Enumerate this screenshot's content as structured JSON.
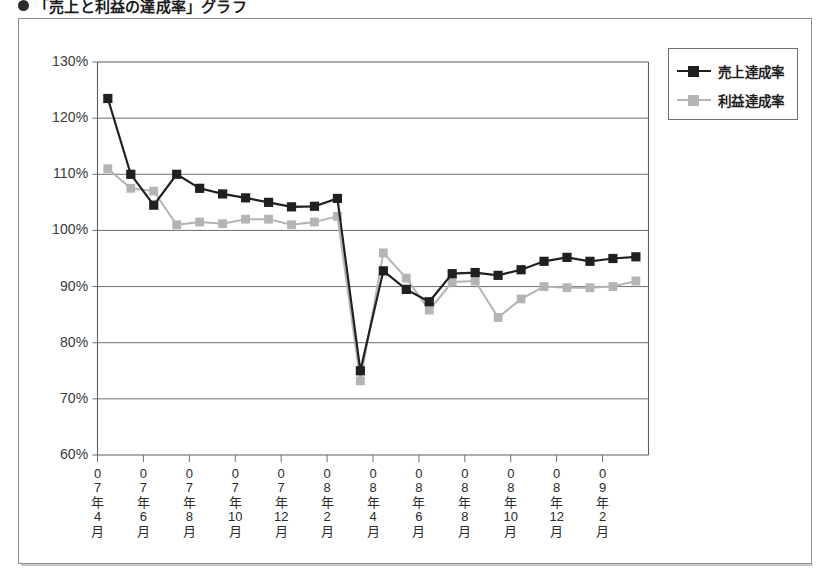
{
  "heading": {
    "bullet_icon": "filled-circle-bullet",
    "text": "「売上と利益の達成率」グラフ"
  },
  "legend": {
    "position": "top-right",
    "items": [
      {
        "label": "売上達成率",
        "color": "#221f1f",
        "marker": "square"
      },
      {
        "label": "利益達成率",
        "color": "#b4b4b4",
        "marker": "square"
      }
    ]
  },
  "axis": {
    "y_ticks": [
      "60%",
      "70%",
      "80%",
      "90%",
      "100%",
      "110%",
      "120%",
      "130%"
    ],
    "x_ticks": [
      {
        "year": "0",
        "year2": "7",
        "nen": "年",
        "month": "4",
        "getsu": "月"
      },
      {
        "year": "0",
        "year2": "7",
        "nen": "年",
        "month": "6",
        "getsu": "月"
      },
      {
        "year": "0",
        "year2": "7",
        "nen": "年",
        "month": "8",
        "getsu": "月"
      },
      {
        "year": "0",
        "year2": "7",
        "nen": "年",
        "month": "10",
        "getsu": "月"
      },
      {
        "year": "0",
        "year2": "7",
        "nen": "年",
        "month": "12",
        "getsu": "月"
      },
      {
        "year": "0",
        "year2": "8",
        "nen": "年",
        "month": "2",
        "getsu": "月"
      },
      {
        "year": "0",
        "year2": "8",
        "nen": "年",
        "month": "4",
        "getsu": "月"
      },
      {
        "year": "0",
        "year2": "8",
        "nen": "年",
        "month": "6",
        "getsu": "月"
      },
      {
        "year": "0",
        "year2": "8",
        "nen": "年",
        "month": "8",
        "getsu": "月"
      },
      {
        "year": "0",
        "year2": "8",
        "nen": "年",
        "month": "10",
        "getsu": "月"
      },
      {
        "year": "0",
        "year2": "8",
        "nen": "年",
        "month": "12",
        "getsu": "月"
      },
      {
        "year": "0",
        "year2": "9",
        "nen": "年",
        "month": "2",
        "getsu": "月"
      }
    ]
  },
  "chart_data": {
    "type": "line",
    "title": "「売上と利益の達成率」グラフ",
    "xlabel": "",
    "ylabel": "",
    "ylim": [
      60,
      130
    ],
    "ytick_step": 10,
    "ytick_format": "percent",
    "grid": "horizontal",
    "legend_position": "top-right",
    "categories": [
      "07年4月",
      "07年5月",
      "07年6月",
      "07年7月",
      "07年8月",
      "07年9月",
      "07年10月",
      "07年11月",
      "07年12月",
      "08年1月",
      "08年2月",
      "08年3月",
      "08年4月",
      "08年5月",
      "08年6月",
      "08年7月",
      "08年8月",
      "08年9月",
      "08年10月",
      "08年11月",
      "08年12月",
      "09年1月",
      "09年2月",
      "09年3月"
    ],
    "series": [
      {
        "name": "売上達成率",
        "color": "#221f1f",
        "values": [
          123.5,
          110.0,
          104.5,
          110.0,
          107.5,
          106.5,
          105.8,
          105.0,
          104.2,
          104.3,
          105.7,
          75.0,
          92.8,
          89.5,
          87.3,
          92.3,
          92.5,
          92.0,
          93.0,
          94.5,
          95.2,
          94.5,
          95.0,
          95.3
        ]
      },
      {
        "name": "利益達成率",
        "color": "#b4b4b4",
        "values": [
          111.0,
          107.5,
          107.0,
          101.0,
          101.5,
          101.2,
          102.0,
          102.0,
          101.0,
          101.5,
          102.5,
          73.2,
          96.0,
          91.5,
          85.8,
          90.8,
          91.0,
          84.5,
          87.8,
          90.0,
          89.8,
          89.8,
          90.0,
          91.0
        ]
      }
    ]
  }
}
